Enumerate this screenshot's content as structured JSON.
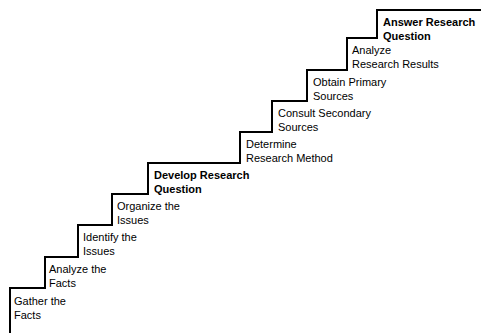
{
  "diagram": {
    "background_color": "#ffffff",
    "line_color": "#000000",
    "text_color": "#000000",
    "steps": [
      {
        "index": 1,
        "line1": "Gather the",
        "line2": "Facts",
        "bold": false,
        "text_x": 14,
        "text_y": 295,
        "riser_x": 10,
        "tread_y": 288
      },
      {
        "index": 2,
        "line1": "Analyze the",
        "line2": "Facts",
        "bold": false,
        "text_x": 49,
        "text_y": 263,
        "riser_x": 45,
        "tread_y": 257
      },
      {
        "index": 3,
        "line1": "Identify the",
        "line2": "Issues",
        "bold": false,
        "text_x": 83,
        "text_y": 231,
        "riser_x": 78,
        "tread_y": 225
      },
      {
        "index": 4,
        "line1": "Organize the",
        "line2": "Issues",
        "bold": false,
        "text_x": 117,
        "text_y": 200,
        "riser_x": 112,
        "tread_y": 194
      },
      {
        "index": 5,
        "line1": "Develop Research",
        "line2": "Question",
        "bold": true,
        "text_x": 154,
        "text_y": 169,
        "riser_x": 148,
        "tread_y": 163
      },
      {
        "index": 6,
        "line1": "Determine",
        "line2": "Research Method",
        "bold": false,
        "text_x": 246,
        "text_y": 138,
        "riser_x": 240,
        "tread_y": 132
      },
      {
        "index": 7,
        "line1": "Consult Secondary",
        "line2": "Sources",
        "bold": false,
        "text_x": 278,
        "text_y": 107,
        "riser_x": 272,
        "tread_y": 101
      },
      {
        "index": 8,
        "line1": "Obtain Primary",
        "line2": "Sources",
        "bold": false,
        "text_x": 313,
        "text_y": 76,
        "riser_x": 307,
        "tread_y": 70
      },
      {
        "index": 9,
        "line1": "Analyze",
        "line2": "Research Results",
        "bold": false,
        "text_x": 352,
        "text_y": 44,
        "riser_x": 347,
        "tread_y": 38
      },
      {
        "index": 10,
        "line1": "Answer Research",
        "line2": "Question",
        "bold": true,
        "text_x": 383,
        "text_y": 16,
        "riser_x": 377,
        "tread_y": 10
      }
    ],
    "staircase_path": "M 10,333 L 10,288 L 45,288 L 45,257 L 78,257 L 78,225 L 112,225 L 112,194 L 148,194 L 148,163 L 240,163 L 240,132 L 272,132 L 272,101 L 307,101 L 307,70 L 347,70 L 347,38 L 377,38 L 377,10 L 481,10"
  }
}
